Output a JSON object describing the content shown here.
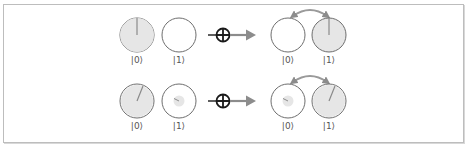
{
  "diagram": {
    "colors": {
      "frame_border": "#bdbdbd",
      "circle_stroke": "#6e6e6e",
      "circle_fill_full": "#e6e6e6",
      "phase_line": "#8a8a8a",
      "arrow": "#8c8c8c",
      "gate": "#1a1a1a"
    },
    "rows": [
      {
        "input": [
          {
            "label": "|0⟩",
            "magnitude": 1.0,
            "phase_deg": 0
          },
          {
            "label": "|1⟩",
            "magnitude": 0.0,
            "phase_deg": 0
          }
        ],
        "gate_symbol": "⊕",
        "output": [
          {
            "label": "|0⟩",
            "magnitude": 0.0,
            "phase_deg": 0
          },
          {
            "label": "|1⟩",
            "magnitude": 1.0,
            "phase_deg": 0
          }
        ],
        "swap_arrow": true
      },
      {
        "input": [
          {
            "label": "|0⟩",
            "magnitude": 0.95,
            "phase_deg": 22
          },
          {
            "label": "|1⟩",
            "magnitude": 0.3,
            "phase_deg": -65
          }
        ],
        "gate_symbol": "⊕",
        "output": [
          {
            "label": "|0⟩",
            "magnitude": 0.3,
            "phase_deg": -65
          },
          {
            "label": "|1⟩",
            "magnitude": 0.95,
            "phase_deg": 22
          }
        ],
        "swap_arrow": true
      }
    ]
  }
}
